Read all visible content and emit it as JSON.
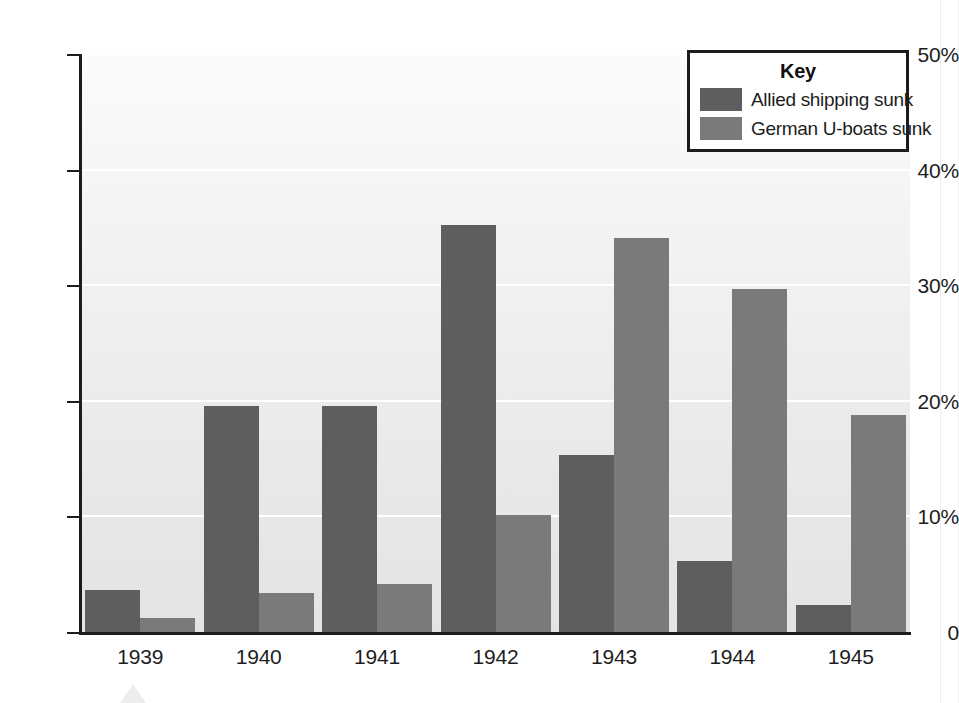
{
  "chart_data": {
    "type": "bar",
    "title": "",
    "xlabel": "",
    "ylabel": "",
    "categories": [
      "1939",
      "1940",
      "1941",
      "1942",
      "1943",
      "1944",
      "1945"
    ],
    "series": [
      {
        "name": "Allied shipping sunk",
        "color": "#5e5e5e",
        "values": [
          3.7,
          19.6,
          19.6,
          35.3,
          15.4,
          6.2,
          2.4
        ]
      },
      {
        "name": "German U-boats sunk",
        "color": "#7a7a7a",
        "values": [
          1.3,
          3.5,
          4.2,
          10.2,
          34.2,
          29.8,
          18.9
        ]
      }
    ],
    "ylim": [
      0,
      50
    ],
    "yticks": [
      0,
      10,
      20,
      30,
      40,
      50
    ],
    "ytick_labels": [
      "0",
      "10%",
      "20%",
      "30%",
      "40%",
      "50%"
    ],
    "grid": "horizontal-white",
    "legend_position": "top-right",
    "legend_title": "Key"
  },
  "legend": {
    "title": "Key",
    "entries": [
      {
        "label": "Allied shipping sunk",
        "color": "#5e5e5e"
      },
      {
        "label": "German U-boats sunk",
        "color": "#7a7a7a"
      }
    ]
  },
  "colors": {
    "series_allied": "#5e5e5e",
    "series_uboats": "#7a7a7a",
    "axis": "#1c1c1c",
    "gridline": "#ffffff",
    "plot_background": "#ededed"
  },
  "ghost": {
    "line1": "shed considerable damage to shipping, which meant that the",
    "line2": "ted food supplies. The success of the German U-boats",
    "line3": "provided a serious threat to Britain's war effort.",
    "line4": "the number of Allied ships sunk and",
    "line5": "the losses suffered by the German navy."
  }
}
